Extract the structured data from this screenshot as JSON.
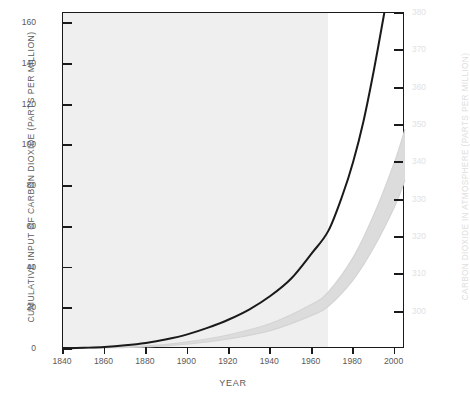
{
  "chart_data": {
    "type": "line",
    "title": "",
    "xlabel": "YEAR",
    "ylabel": "CUMULATIVE INPUT OF CARBON DIOXIDE (PARTS PER MILLION)",
    "ylabel_right": "CARBON DIOXIDE IN ATMOSPHERE (PARTS PER MILLION)",
    "xlim": [
      1840,
      2005
    ],
    "ylim": [
      0,
      165
    ],
    "ylim_right": [
      290,
      380
    ],
    "grid": false,
    "legend": null,
    "xticks": [
      1840,
      1860,
      1880,
      1900,
      1920,
      1940,
      1960,
      1980,
      2000
    ],
    "xticklabels": [
      "1840",
      "1860",
      "1880",
      "1900",
      "1920",
      "1940",
      "1960",
      "1980",
      "2000"
    ],
    "yticks_left": [
      0,
      20,
      40,
      60,
      80,
      100,
      120,
      140,
      160
    ],
    "yticklabels_left": [
      "0",
      "20",
      "40",
      "60",
      "80",
      "100",
      "120",
      "140",
      "160"
    ],
    "yticks_right": [
      300,
      310,
      320,
      330,
      340,
      350,
      360,
      370,
      380
    ],
    "yticklabels_right": [
      "300",
      "310",
      "320",
      "330",
      "340",
      "350",
      "360",
      "370",
      "380"
    ],
    "shaded_panel": {
      "x_start": 1840,
      "x_end": 1968,
      "color": "#efefef",
      "note": "light gray background panel covering the observed-record period"
    },
    "series": [
      {
        "name": "Cumulative input of carbon dioxide",
        "type": "line",
        "style": "solid",
        "color": "#1a1a1a",
        "width": 2.0,
        "x": [
          1840,
          1850,
          1860,
          1870,
          1880,
          1890,
          1900,
          1910,
          1920,
          1930,
          1940,
          1950,
          1960,
          1968,
          1975,
          1980,
          1985,
          1990,
          1995
        ],
        "y": [
          0.3,
          0.6,
          1.0,
          1.8,
          3.0,
          4.8,
          7.2,
          10.5,
          14.5,
          19.5,
          26.0,
          34.5,
          47.0,
          58.0,
          76.0,
          92.0,
          112.0,
          137.0,
          165.0
        ]
      },
      {
        "name": "Carbon dioxide in atmosphere (upper bound)",
        "type": "band-edge",
        "style": "solid",
        "color": "#d9d9d9",
        "x": [
          1840,
          1880,
          1900,
          1920,
          1940,
          1960,
          1968,
          1980,
          1990,
          2000,
          2005
        ],
        "y": [
          0.2,
          1.5,
          3.5,
          7.0,
          12.5,
          22.0,
          28.0,
          45.0,
          66.0,
          92.0,
          108.0
        ]
      },
      {
        "name": "Carbon dioxide in atmosphere (lower bound)",
        "type": "band-edge",
        "style": "solid",
        "color": "#d9d9d9",
        "x": [
          1840,
          1880,
          1900,
          1920,
          1940,
          1960,
          1968,
          1980,
          1990,
          2000,
          2005
        ],
        "y": [
          0.1,
          1.0,
          2.4,
          5.0,
          9.0,
          16.5,
          21.0,
          34.0,
          50.0,
          70.0,
          83.0
        ]
      }
    ],
    "band": {
      "name": "Projected range of atmospheric carbon dioxide",
      "color": "#dcdcdc",
      "opacity": 1.0
    }
  }
}
